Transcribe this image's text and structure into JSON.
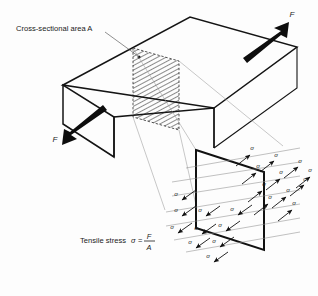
{
  "figure": {
    "title_label": "Cross-sectional area A",
    "area_symbol": "A",
    "formula_prefix": "Tensile stress",
    "formula_sigma": "σ",
    "formula_equals": "=",
    "formula_numerator": "F",
    "formula_denominator": "A",
    "force_label": "F",
    "stress_symbol": "σ",
    "background_color": "#fdfdfd",
    "ink_color": "#141414",
    "projection_color": "#9a9a9a"
  },
  "forces": [
    {
      "name": "force-upper-right",
      "label": "F",
      "direction": "up-right",
      "x": 292,
      "y": 17
    },
    {
      "name": "force-lower-left",
      "label": "F",
      "direction": "down-left",
      "x": 55,
      "y": 139
    }
  ],
  "stress_arrows_right": [
    {
      "label": "σ",
      "x": 252,
      "y": 150
    },
    {
      "label": "σ",
      "x": 276,
      "y": 157
    },
    {
      "label": "σ",
      "x": 300,
      "y": 163
    },
    {
      "label": "σ",
      "x": 258,
      "y": 168
    },
    {
      "label": "σ",
      "x": 281,
      "y": 174
    },
    {
      "label": "σ",
      "x": 305,
      "y": 181
    },
    {
      "label": "σ",
      "x": 264,
      "y": 186
    },
    {
      "label": "σ",
      "x": 288,
      "y": 192
    },
    {
      "label": "σ",
      "x": 310,
      "y": 172
    },
    {
      "label": "σ",
      "x": 294,
      "y": 205
    },
    {
      "label": "σ",
      "x": 270,
      "y": 199
    }
  ],
  "stress_arrows_left": [
    {
      "label": "σ",
      "x": 176,
      "y": 196
    },
    {
      "label": "σ",
      "x": 176,
      "y": 212
    },
    {
      "label": "σ",
      "x": 200,
      "y": 212
    },
    {
      "label": "σ",
      "x": 172,
      "y": 229
    },
    {
      "label": "σ",
      "x": 196,
      "y": 230
    },
    {
      "label": "σ",
      "x": 220,
      "y": 227
    },
    {
      "label": "σ",
      "x": 190,
      "y": 244
    },
    {
      "label": "σ",
      "x": 214,
      "y": 243
    },
    {
      "label": "σ",
      "x": 208,
      "y": 258
    },
    {
      "label": "σ",
      "x": 232,
      "y": 211
    }
  ]
}
